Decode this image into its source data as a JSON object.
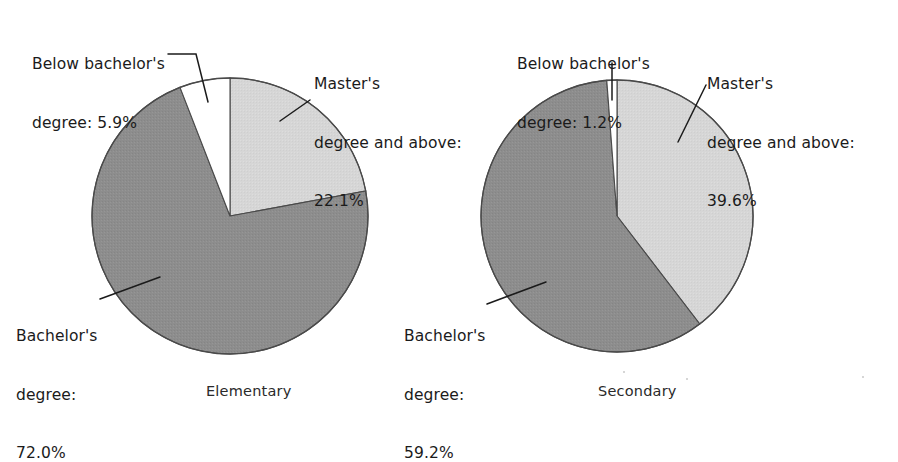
{
  "figure": {
    "background": "#ffffff",
    "text_color": "#1b1b1b"
  },
  "colors": {
    "below_bachelors": "#ffffff",
    "bachelors_degree": "#8d8d8d",
    "masters_and_above": "#d6d6d6",
    "outline": "#4a4a4a",
    "leader_line": "#1b1b1b"
  },
  "charts": {
    "left": {
      "caption": "Elementary",
      "labels": {
        "below": "Below bachelor's\ndegree: 5.9%",
        "below_line1": "Below bachelor's",
        "below_line2": "degree: 5.9%",
        "master": "Master's\ndegree and above:\n22.1%",
        "master_line1": "Master's",
        "master_line2": "degree and above:",
        "master_line3": "22.1%",
        "bachelor": "Bachelor's\ndegree:\n72.0%",
        "bachelor_line1": "Bachelor's",
        "bachelor_line2": "degree:",
        "bachelor_line3": "72.0%"
      }
    },
    "right": {
      "caption": "Secondary",
      "labels": {
        "below": "Below bachelor's\ndegree: 1.2%",
        "below_line1": "Below bachelor's",
        "below_line2": "degree: 1.2%",
        "master": "Master's\ndegree and above:\n39.6%",
        "master_line1": "Master's",
        "master_line2": "degree and above:",
        "master_line3": "39.6%",
        "bachelor": "Bachelor's\ndegree:\n59.2%",
        "bachelor_line1": "Bachelor's",
        "bachelor_line2": "degree:",
        "bachelor_line3": "59.2%"
      }
    }
  },
  "chart_data": [
    {
      "type": "pie",
      "title": "Elementary",
      "categories": [
        "Master's degree and above",
        "Bachelor's degree",
        "Below bachelor's degree"
      ],
      "values": [
        22.1,
        72.0,
        5.9
      ],
      "unit": "percent",
      "slice_colors": [
        "#d6d6d6",
        "#8d8d8d",
        "#ffffff"
      ],
      "start_angle_deg": 0,
      "direction": "clockwise",
      "legend": "labels-with-leader-lines",
      "center_px": [
        230,
        216
      ],
      "radius_px": 138,
      "labels": [
        "Master's degree and above: 22.1%",
        "Bachelor's degree: 72.0%",
        "Below bachelor's degree: 5.9%"
      ]
    },
    {
      "type": "pie",
      "title": "Secondary",
      "categories": [
        "Master's degree and above",
        "Bachelor's degree",
        "Below bachelor's degree"
      ],
      "values": [
        39.6,
        59.2,
        1.2
      ],
      "unit": "percent",
      "slice_colors": [
        "#d6d6d6",
        "#8d8d8d",
        "#ffffff"
      ],
      "start_angle_deg": 0,
      "direction": "clockwise",
      "legend": "labels-with-leader-lines",
      "center_px": [
        617,
        216
      ],
      "radius_px": 136,
      "labels": [
        "Master's degree and above: 39.6%",
        "Bachelor's degree: 59.2%",
        "Below bachelor's degree: 1.2%"
      ]
    }
  ]
}
